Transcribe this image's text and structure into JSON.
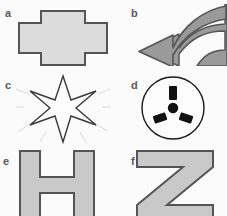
{
  "figure": {
    "background_color": "#fbfbfb",
    "columns": 2,
    "rows": 3,
    "label_color": "#5a5a5a"
  },
  "palette": {
    "outline_dark": "#555555",
    "outline_black": "#1a1a1a",
    "fill_light_gray": "#dcdcdc",
    "fill_letter_gray": "#c9c9c9",
    "fill_medium_gray": "#9a9a9a",
    "fill_white": "#fcfcfc",
    "fill_black": "#111111",
    "sparkle_gray": "#d8d8d8"
  },
  "panels": [
    {
      "id": "a",
      "label": "a",
      "shape_name": "cross-plus-polygon",
      "description": "Horizontally elongated cross / plus shaped polygon",
      "fill": "#dcdcdc",
      "stroke": "#555555",
      "stroke_width": 2
    },
    {
      "id": "b",
      "label": "b",
      "shape_name": "curved-left-arrow",
      "description": "Thick curved arrow sweeping from upper right down to a leftward pointing head",
      "fill": "#9a9a9a",
      "stroke": "#555555",
      "stroke_width": 1.5
    },
    {
      "id": "c",
      "label": "c",
      "shape_name": "six-pointed-star",
      "description": "Six pointed star outline with faint radiating sparkle rays",
      "fill": "#fcfcfc",
      "stroke": "#3a3a3a",
      "stroke_width": 1.4,
      "sparkle_color": "#d8d8d8",
      "points": 6
    },
    {
      "id": "d",
      "label": "d",
      "shape_name": "socket-circle",
      "description": "Circle outline containing a center dot and three radiating rectangular slots",
      "fill": "#fcfcfc",
      "stroke": "#1a1a1a",
      "stroke_width": 1.4,
      "slot_fill": "#111111",
      "slot_count": 3
    },
    {
      "id": "e",
      "label": "e",
      "shape_name": "block-letter-h",
      "description": "Thick block capital letter H, cropped at the bottom edge",
      "fill": "#c9c9c9",
      "stroke": "#555555",
      "stroke_width": 2,
      "glyph": "H"
    },
    {
      "id": "f",
      "label": "f",
      "shape_name": "block-letter-z",
      "description": "Thick block capital letter Z with diagonal stroke, cropped at the bottom edge",
      "fill": "#c9c9c9",
      "stroke": "#555555",
      "stroke_width": 2,
      "glyph": "Z"
    }
  ]
}
